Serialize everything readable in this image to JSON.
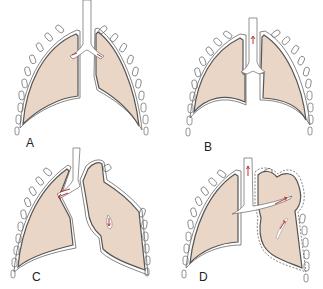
{
  "figure": {
    "colors": {
      "lung_fill": "#ead6c6",
      "outline": "#555555",
      "arrow": "#b33333",
      "background": "#ffffff"
    },
    "panels": [
      {
        "id": "A",
        "label": "A",
        "description": "Normal lungs with intact pleura and trachea"
      },
      {
        "id": "B",
        "label": "B",
        "description": "Lungs with small airway flow arrow in trachea"
      },
      {
        "id": "C",
        "label": "C",
        "description": "Right lung with airflow into bronchus; left lung collapsed with pleural tear"
      },
      {
        "id": "D",
        "label": "D",
        "description": "Left lung hyperexpanded with air flow through bronchus into lung"
      }
    ]
  }
}
